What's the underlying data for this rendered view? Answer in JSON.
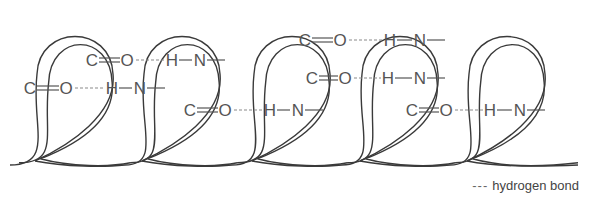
{
  "diagram": {
    "type": "alpha-helix",
    "stroke_color": "#3a3a3a",
    "bond_color": "#555555",
    "dash_color": "#8a8a8a",
    "loops": [
      {
        "cx": 75
      },
      {
        "cx": 182
      },
      {
        "cx": 292
      },
      {
        "cx": 400
      },
      {
        "cx": 507
      }
    ],
    "bonds": [
      {
        "y": 60,
        "c_x": 92,
        "o_x": 127,
        "h_x": 172,
        "n_x": 200,
        "label_c": "C",
        "label_o": "O",
        "label_h": "H",
        "label_n": "N"
      },
      {
        "y": 88,
        "c_x": 30,
        "o_x": 66,
        "h_x": 112,
        "n_x": 140,
        "label_c": "C",
        "label_o": "O",
        "label_h": "H",
        "label_n": "N"
      },
      {
        "y": 110,
        "c_x": 190,
        "o_x": 225,
        "h_x": 270,
        "n_x": 298,
        "label_c": "C",
        "label_o": "O",
        "label_h": "H",
        "label_n": "N"
      },
      {
        "y": 40,
        "c_x": 305,
        "o_x": 340,
        "h_x": 390,
        "n_x": 420,
        "label_c": "C",
        "label_o": "O",
        "label_h": "H",
        "label_n": "N"
      },
      {
        "y": 78,
        "c_x": 312,
        "o_x": 345,
        "h_x": 388,
        "n_x": 420,
        "label_c": "C",
        "label_o": "O",
        "label_h": "H",
        "label_n": "N"
      },
      {
        "y": 110,
        "c_x": 412,
        "o_x": 446,
        "h_x": 490,
        "n_x": 520,
        "label_c": "C",
        "label_o": "O",
        "label_h": "H",
        "label_n": "N"
      }
    ]
  },
  "legend": {
    "symbol": "---",
    "label": "hydrogen bond"
  }
}
